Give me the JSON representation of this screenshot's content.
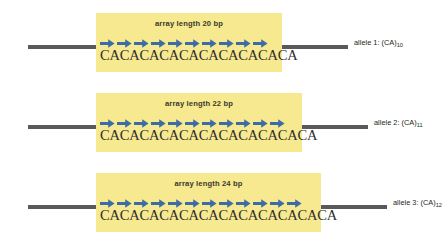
{
  "figure": {
    "type": "diagram",
    "background": "#ffffff",
    "colors": {
      "array_highlight": "#f6e98f",
      "dna_line": "#595959",
      "repeat_arrow": "#3c6ca8",
      "sequence_text": "#2e2e2e",
      "caption_text": "#231f20"
    }
  },
  "rows": [
    {
      "array_label": "array length 20 bp",
      "sequence": "CACACACACACACACACACA",
      "repeat_count": 10,
      "allele_caption": "allele 1: (CA)",
      "allele_subscript": "10",
      "box_left": 96,
      "box_width": 186,
      "box_top": 13,
      "box_height": 59,
      "row_top": 0,
      "line_left_width": 68,
      "line_right_left": 282,
      "line_right_width": 66
    },
    {
      "array_label": "array length 22 bp",
      "sequence": "CACACACACACACACACACACA",
      "repeat_count": 11,
      "allele_caption": "allele 2: (CA)",
      "allele_subscript": "11",
      "box_left": 96,
      "box_width": 206,
      "box_top": 13,
      "box_height": 59,
      "row_top": 80,
      "line_left_width": 68,
      "line_right_left": 302,
      "line_right_width": 66
    },
    {
      "array_label": "array length 24 bp",
      "sequence": "CACACACACACACACACACACACA",
      "repeat_count": 12,
      "allele_caption": "allele 3: (CA)",
      "allele_subscript": "12",
      "box_left": 96,
      "box_width": 225,
      "box_top": 13,
      "box_height": 59,
      "row_top": 160,
      "line_left_width": 68,
      "line_right_left": 321,
      "line_right_width": 66
    }
  ]
}
